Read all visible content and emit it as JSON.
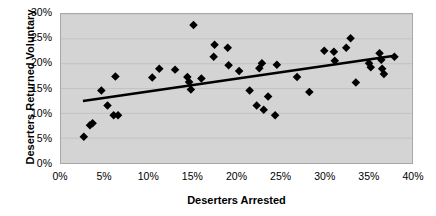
{
  "chart_data": {
    "type": "scatter",
    "title": "",
    "xlabel": "Deserters Arrested",
    "ylabel": "Deserters Returned Voluntary",
    "xlim": [
      0,
      40
    ],
    "ylim": [
      0,
      30
    ],
    "xticks": [
      "0%",
      "5%",
      "10%",
      "15%",
      "20%",
      "25%",
      "30%",
      "35%",
      "40%"
    ],
    "xtick_values": [
      0,
      5,
      10,
      15,
      20,
      25,
      30,
      35,
      40
    ],
    "yticks": [
      "0%",
      "5%",
      "10%",
      "15%",
      "20%",
      "25%",
      "30%"
    ],
    "ytick_values": [
      0,
      5,
      10,
      15,
      20,
      25,
      30
    ],
    "grid": "horizontal",
    "legend": "none",
    "plot_background": "#d4d4d4",
    "marker": "diamond",
    "marker_color": "#000000",
    "points": [
      {
        "x": 2.6,
        "y": 5.3
      },
      {
        "x": 3.3,
        "y": 7.6
      },
      {
        "x": 3.6,
        "y": 8.0
      },
      {
        "x": 4.6,
        "y": 14.6
      },
      {
        "x": 5.3,
        "y": 11.6
      },
      {
        "x": 6.0,
        "y": 9.6
      },
      {
        "x": 6.5,
        "y": 9.6
      },
      {
        "x": 6.2,
        "y": 17.4
      },
      {
        "x": 10.4,
        "y": 17.2
      },
      {
        "x": 11.2,
        "y": 19.0
      },
      {
        "x": 13.0,
        "y": 18.8
      },
      {
        "x": 14.4,
        "y": 17.3
      },
      {
        "x": 14.6,
        "y": 16.3
      },
      {
        "x": 14.8,
        "y": 14.8
      },
      {
        "x": 16.0,
        "y": 17.0
      },
      {
        "x": 15.1,
        "y": 27.8
      },
      {
        "x": 17.5,
        "y": 23.8
      },
      {
        "x": 17.4,
        "y": 21.4
      },
      {
        "x": 19.0,
        "y": 23.2
      },
      {
        "x": 19.1,
        "y": 19.7
      },
      {
        "x": 20.3,
        "y": 18.5
      },
      {
        "x": 21.5,
        "y": 14.6
      },
      {
        "x": 22.3,
        "y": 11.6
      },
      {
        "x": 22.6,
        "y": 19.1
      },
      {
        "x": 22.9,
        "y": 20.1
      },
      {
        "x": 23.1,
        "y": 10.7
      },
      {
        "x": 23.6,
        "y": 13.4
      },
      {
        "x": 24.4,
        "y": 9.6
      },
      {
        "x": 24.6,
        "y": 19.8
      },
      {
        "x": 26.9,
        "y": 17.3
      },
      {
        "x": 28.3,
        "y": 14.3
      },
      {
        "x": 30.0,
        "y": 22.6
      },
      {
        "x": 31.1,
        "y": 22.4
      },
      {
        "x": 31.2,
        "y": 20.6
      },
      {
        "x": 32.5,
        "y": 23.2
      },
      {
        "x": 33.0,
        "y": 25.1
      },
      {
        "x": 33.6,
        "y": 16.2
      },
      {
        "x": 35.1,
        "y": 20.1
      },
      {
        "x": 35.3,
        "y": 19.3
      },
      {
        "x": 36.3,
        "y": 22.1
      },
      {
        "x": 36.5,
        "y": 20.8
      },
      {
        "x": 36.6,
        "y": 19.0
      },
      {
        "x": 36.8,
        "y": 17.9
      },
      {
        "x": 38.0,
        "y": 21.4
      }
    ],
    "trendline": {
      "type": "linear",
      "x0": 2.5,
      "y0": 12.5,
      "x1": 38.0,
      "y1": 21.6,
      "color": "#000000",
      "width": 2.6
    }
  }
}
